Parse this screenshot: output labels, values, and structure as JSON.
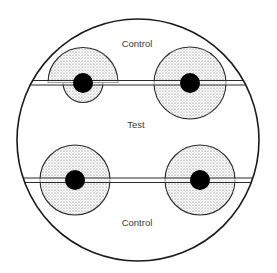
{
  "diagram": {
    "colors": {
      "outline": "#1a1a1a",
      "zone_fill": "#d9d9d9",
      "zone_dots": "#555555",
      "disc": "#000000",
      "background": "#ffffff",
      "text": "#3a3a3a"
    },
    "labels": {
      "top": "Control",
      "middle": "Test",
      "bottom": "Control"
    },
    "strips": [
      {
        "name": "upper-strip"
      },
      {
        "name": "lower-strip"
      }
    ],
    "zones": [
      {
        "name": "zone-upper-left",
        "position": "upper-left",
        "shape": "asymmetric",
        "note": "larger above strip (control side), smaller below strip (test side)"
      },
      {
        "name": "zone-upper-right",
        "position": "upper-right",
        "shape": "circular"
      },
      {
        "name": "zone-lower-left",
        "position": "lower-left",
        "shape": "circular"
      },
      {
        "name": "zone-lower-right",
        "position": "lower-right",
        "shape": "circular"
      }
    ]
  }
}
